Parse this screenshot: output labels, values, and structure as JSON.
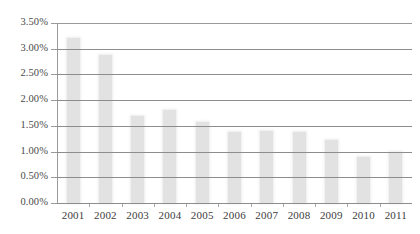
{
  "chart_data": {
    "type": "bar",
    "title": "",
    "subtitle": "",
    "xlabel": "",
    "ylabel": "",
    "categories": [
      "2001",
      "2002",
      "2003",
      "2004",
      "2005",
      "2006",
      "2007",
      "2008",
      "2009",
      "2010",
      "2011"
    ],
    "values": [
      3.2,
      2.87,
      1.7,
      1.8,
      1.58,
      1.38,
      1.4,
      1.39,
      1.22,
      0.9,
      1.0
    ],
    "ylim": [
      0.0,
      3.5
    ],
    "ytick_values": [
      0.0,
      0.5,
      1.0,
      1.5,
      2.0,
      2.5,
      3.0,
      3.5
    ],
    "ytick_labels": [
      "0.00%",
      "0.50%",
      "1.00%",
      "1.50%",
      "2.00%",
      "2.50%",
      "3.00%",
      "3.50%"
    ],
    "grid": true,
    "grid_axis": "y",
    "legend": false,
    "legend_position": "none",
    "series": [
      {
        "name": "",
        "values": [
          3.2,
          2.87,
          1.7,
          1.8,
          1.58,
          1.38,
          1.4,
          1.39,
          1.22,
          0.9,
          1.0
        ]
      }
    ],
    "colors": {
      "bar_fill": "#e2e2e2",
      "gridline": "#8d8d8d",
      "axis_line": "#9a9a9a",
      "tick_label": "#3d3d3d",
      "background": "#ffffff"
    }
  }
}
